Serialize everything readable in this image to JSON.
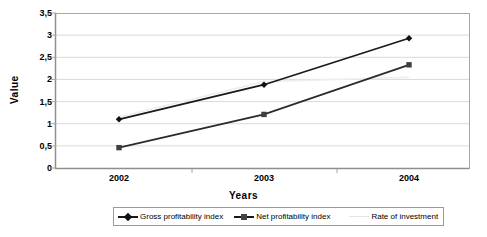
{
  "chart_data": {
    "type": "line",
    "title": "",
    "xlabel": "Years",
    "ylabel": "Value",
    "categories": [
      "2002",
      "2003",
      "2004"
    ],
    "ylim": [
      0,
      3.5
    ],
    "yticks": [
      "0",
      "0,5",
      "1",
      "1,5",
      "2",
      "2,5",
      "3",
      "3,5"
    ],
    "ytick_values": [
      0,
      0.5,
      1,
      1.5,
      2,
      2.5,
      3,
      3.5
    ],
    "grid": true,
    "legend_position": "bottom",
    "decimal_separator": ",",
    "series": [
      {
        "name": "Gross profitability index",
        "marker": "diamond",
        "color": "#1a1a1a",
        "values": [
          1.1,
          1.88,
          2.93
        ]
      },
      {
        "name": "Net profitability index",
        "marker": "square",
        "color": "#3a3a3a",
        "values": [
          0.46,
          1.21,
          2.33
        ]
      },
      {
        "name": "Rate of investment",
        "marker": "none",
        "color": "#eeeeee",
        "values": [
          1.15,
          1.95,
          2.05
        ]
      }
    ]
  },
  "axis": {
    "ylabel": "Value",
    "xlabel": "Years"
  },
  "legend": {
    "items": [
      {
        "label": "Gross profitability index"
      },
      {
        "label": "Net profitability index"
      },
      {
        "label": "Rate of investment"
      }
    ]
  },
  "colors": {
    "plot_border": "#a6a6a6",
    "gridline": "#d9d9d9",
    "series1": "#1a1a1a",
    "series2": "#3a3a3a",
    "series3": "#eeeeee",
    "background": "#ffffff"
  }
}
